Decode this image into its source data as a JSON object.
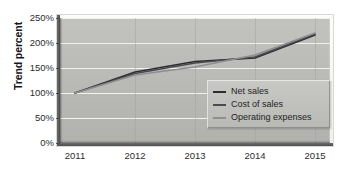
{
  "chart_data": {
    "type": "line",
    "title": "",
    "subtitle": "",
    "xlabel": "",
    "ylabel": "Trend percent",
    "categories": [
      "2011",
      "2012",
      "2013",
      "2014",
      "2015"
    ],
    "x": [
      2011,
      2012,
      2013,
      2014,
      2015
    ],
    "series": [
      {
        "name": "Net sales",
        "color": "#2b2b30",
        "values": [
          100,
          142,
          163,
          170,
          216
        ]
      },
      {
        "name": "Cost of sales",
        "color": "#4a4a50",
        "values": [
          100,
          139,
          160,
          172,
          218
        ]
      },
      {
        "name": "Operating expenses",
        "color": "#8f8f92",
        "values": [
          100,
          136,
          152,
          176,
          220
        ]
      }
    ],
    "ylim": [
      0,
      250
    ],
    "yticks": [
      0,
      50,
      100,
      150,
      200,
      250
    ],
    "ytick_labels": [
      "0%",
      "50%",
      "100%",
      "150%",
      "200%",
      "250%"
    ],
    "grid": true,
    "grid_axis": "y",
    "grid_color": "#f6f6f4",
    "legend_position": "inside-lower-right",
    "plot_background": "#b9b9b6",
    "figure_background": "#ffffff",
    "annotations": []
  },
  "axes": {
    "y_title": "Trend percent",
    "y_tick_labels": [
      "250%",
      "200%",
      "150%",
      "100%",
      "50%",
      "0%"
    ],
    "x_tick_labels": [
      "2011",
      "2012",
      "2013",
      "2014",
      "2015"
    ]
  },
  "legend": {
    "entries": [
      {
        "label": "Net sales",
        "color": "#2b2b30"
      },
      {
        "label": "Cost of sales",
        "color": "#4a4a50"
      },
      {
        "label": "Operating expenses",
        "color": "#8f8f92"
      }
    ]
  }
}
